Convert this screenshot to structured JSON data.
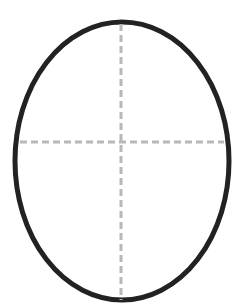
{
  "diagram": {
    "shape": "ellipse",
    "ellipse": {
      "cx": 122,
      "cy": 161,
      "rx": 107,
      "ry": 139,
      "stroke": "#222222",
      "stroke_width": 5,
      "fill": "#ffffff"
    },
    "guides": {
      "color": "#b8b8b8",
      "dash": "7 4",
      "width": 3,
      "vertical": {
        "x": 121,
        "y1": 24,
        "y2": 300
      },
      "horizontal": {
        "y": 142,
        "x1": 20,
        "x2": 224
      }
    }
  }
}
